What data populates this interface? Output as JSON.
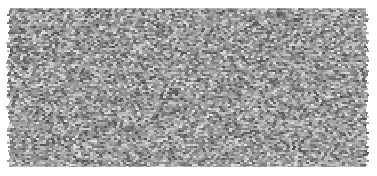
{
  "image": {
    "kind": "grayscale-noise-texture",
    "description": "Rectangular block of random gray tiles in an offset brick grid on a white background",
    "width": 377,
    "height": 176,
    "background_color": "#ffffff"
  },
  "texture": {
    "region": {
      "left": 7,
      "top": 8,
      "right": 369,
      "bottom": 167,
      "width": 362,
      "height": 159
    },
    "tile": {
      "width": 3,
      "height": 2,
      "row_offset": 1,
      "offset_mode": "brick"
    },
    "edges": {
      "top": "straight",
      "bottom": "straight",
      "left": "serrated",
      "right": "serrated",
      "serration_amplitude": 3
    },
    "tone": {
      "mean_gray": 153,
      "min_gray": 60,
      "max_gray": 246,
      "spread": 80,
      "palette": [
        "#3c3c3c",
        "#555555",
        "#6e6e6e",
        "#808080",
        "#8c8c8c",
        "#999999",
        "#a6a6a6",
        "#b3b3b3",
        "#c0c0c0",
        "#d0d0d0",
        "#e0e0e0",
        "#f6f6f6"
      ],
      "distribution": "uniform-random"
    },
    "noise_seed": 20240917
  },
  "chart_data": {
    "type": "heatmap",
    "title": "",
    "xlabel": "",
    "ylabel": "",
    "colormap": "gray",
    "vmin": 60,
    "vmax": 246,
    "grid": false,
    "legend": "none",
    "cols": 121,
    "rows": 80,
    "note": "Random uniform grayscale values rendered as an offset tile mosaic"
  }
}
